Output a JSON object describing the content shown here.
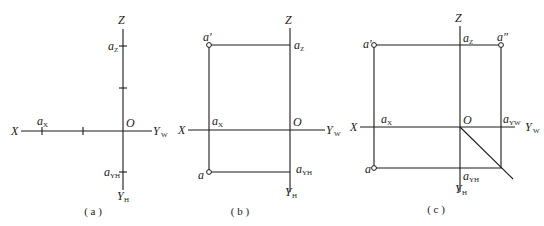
{
  "figures": [
    {
      "id": "a",
      "caption": "( a )",
      "labels": {
        "Z": "Z",
        "X": "X",
        "O": "O",
        "YW": "Y",
        "YW_sub": "W",
        "YH": "Y",
        "YH_sub": "H",
        "az": "a",
        "az_sub": "Z",
        "ax": "a",
        "ax_sub": "X",
        "ayh": "a",
        "ayh_sub": "YH"
      }
    },
    {
      "id": "b",
      "caption": "( b )",
      "labels": {
        "Z": "Z",
        "X": "X",
        "O": "O",
        "YW": "Y",
        "YW_sub": "W",
        "YH": "Y",
        "YH_sub": "H",
        "a_prime": "a′",
        "a": "a",
        "az": "a",
        "az_sub": "Z",
        "ax": "a",
        "ax_sub": "X",
        "ayh": "a",
        "ayh_sub": "YH"
      }
    },
    {
      "id": "c",
      "caption": "( c )",
      "labels": {
        "Z": "Z",
        "X": "X",
        "O": "O",
        "YW": "Y",
        "YW_sub": "W",
        "YH": "Y",
        "YH_sub": "H",
        "a_prime": "a′",
        "a_dprime": "a″",
        "a": "a",
        "az": "a",
        "az_sub": "Z",
        "ax": "a",
        "ax_sub": "X",
        "ayw": "a",
        "ayw_sub": "YW",
        "ayh": "a",
        "ayh_sub": "YH"
      }
    }
  ]
}
